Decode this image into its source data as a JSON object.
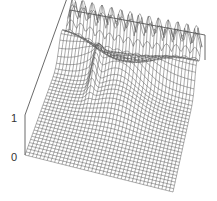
{
  "chart_data": {
    "type": "surface",
    "title": "",
    "xlabel": "",
    "ylabel": "",
    "zlabel": "",
    "z_ticks": [
      "0",
      "1"
    ],
    "zlim": [
      0,
      1
    ],
    "grid_resolution": [
      40,
      40
    ],
    "features": [
      {
        "name": "back-edge oscillation ridge",
        "height": 1.0
      },
      {
        "name": "central broad hump",
        "height": 0.55
      },
      {
        "name": "narrow left spike",
        "height": 0.8
      },
      {
        "name": "flat foreground",
        "height": 0.0
      }
    ],
    "line_color": "#555555",
    "background": "#ffffff"
  },
  "axis": {
    "z_top_label": "1",
    "z_bottom_label": "0"
  }
}
